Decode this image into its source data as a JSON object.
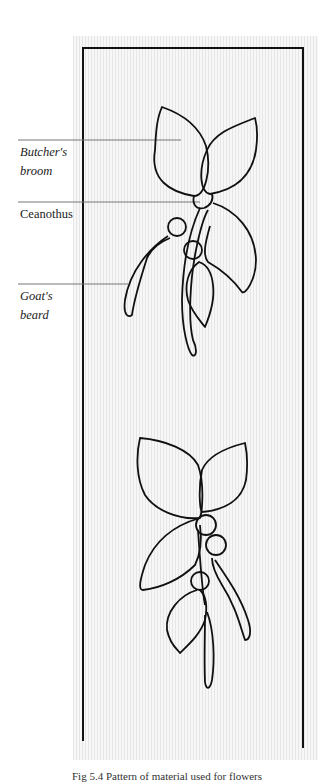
{
  "figure": {
    "labels": [
      {
        "id": "butchers-broom",
        "line1": "Butcher's",
        "line2": "broom",
        "italic": true
      },
      {
        "id": "ceanothus",
        "line1": "Ceanothus",
        "line2": "",
        "italic": false
      },
      {
        "id": "goats-beard",
        "line1": "Goat's",
        "line2": "beard",
        "italic": true
      }
    ],
    "caption": "Fig 5.4 Pattern of material used for flowers"
  },
  "colors": {
    "ink": "#111111",
    "leader": "#777777",
    "panel": "#f4f4f4"
  }
}
